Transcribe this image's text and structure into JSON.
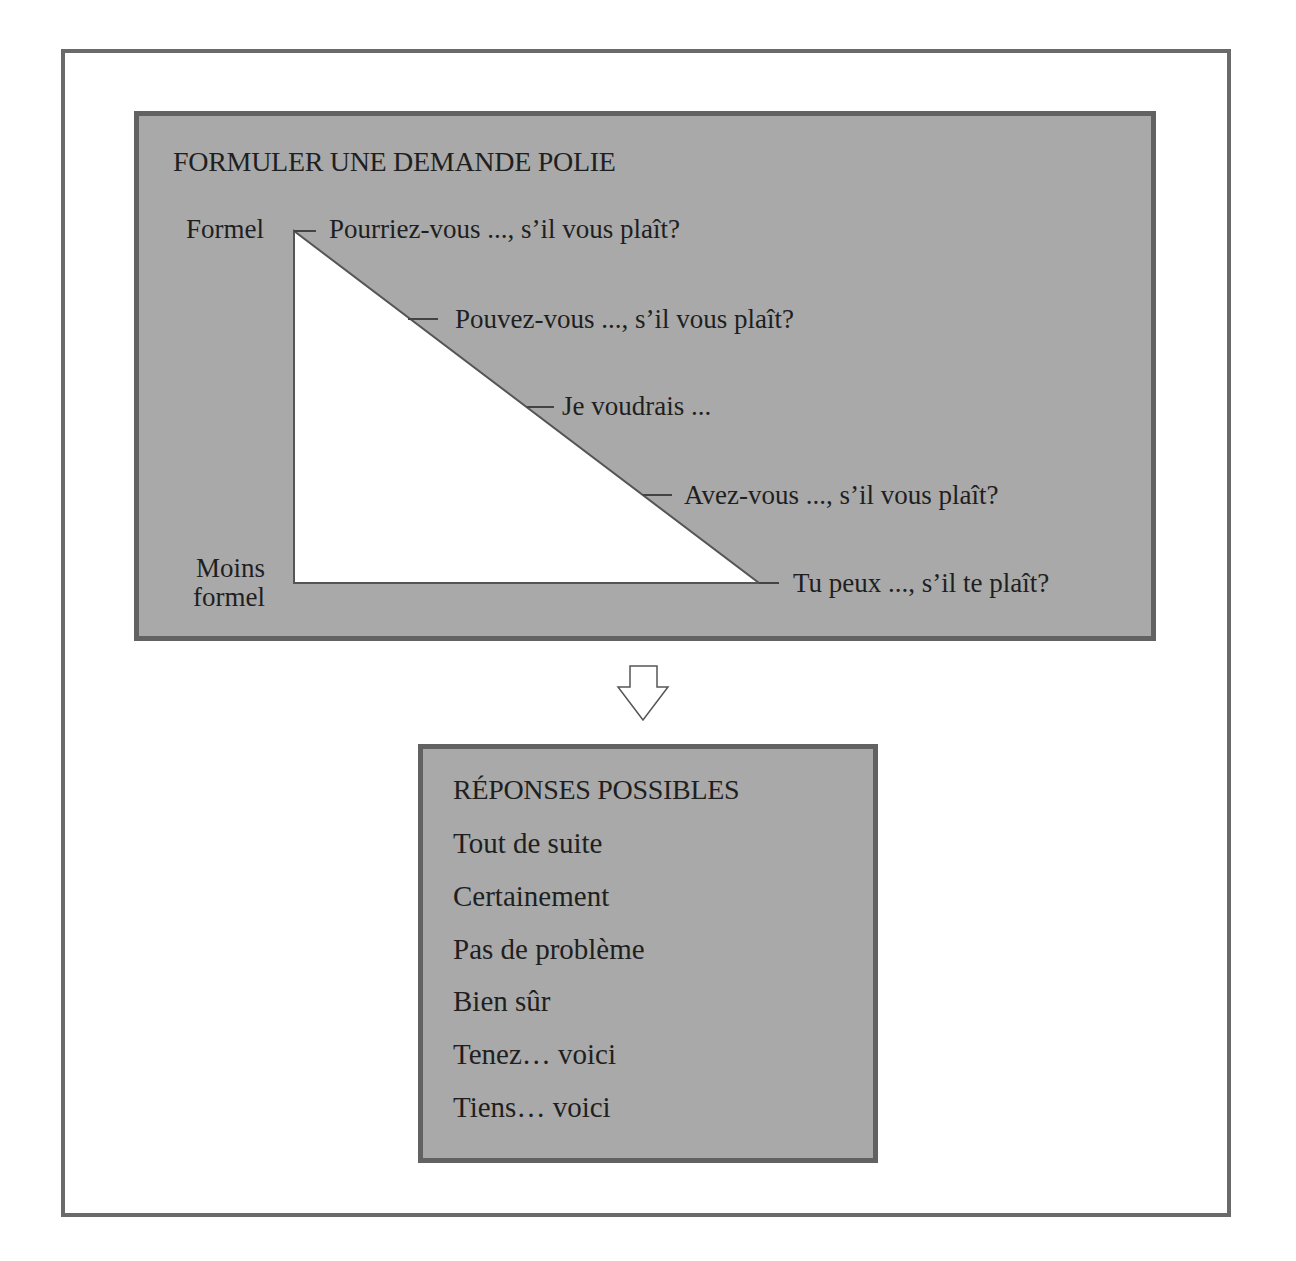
{
  "request_panel": {
    "title": "FORMULER UNE DEMANDE POLIE",
    "scale_top_label": "Formel",
    "scale_bottom_label_line1": "Moins",
    "scale_bottom_label_line2": "formel",
    "phrases": [
      "Pourriez-vous ..., s’il vous plaît?",
      "Pouvez-vous ..., s’il vous plaît?",
      "Je voudrais ...",
      "Avez-vous ..., s’il vous plaît?",
      "Tu peux ..., s’il te plaît?"
    ]
  },
  "arrow": {
    "icon": "down-arrow-outline-icon"
  },
  "responses_panel": {
    "title": "RÉPONSES POSSIBLES",
    "items": [
      "Tout de suite",
      "Certainement",
      "Pas de problème",
      "Bien sûr",
      "Tenez… voici",
      "Tiens… voici"
    ]
  },
  "colors": {
    "panel_fill": "#a9a9a9",
    "panel_border": "#626262",
    "frame_border": "#6a6a6a",
    "triangle_fill": "#ffffff",
    "text": "#1f1f1f"
  }
}
